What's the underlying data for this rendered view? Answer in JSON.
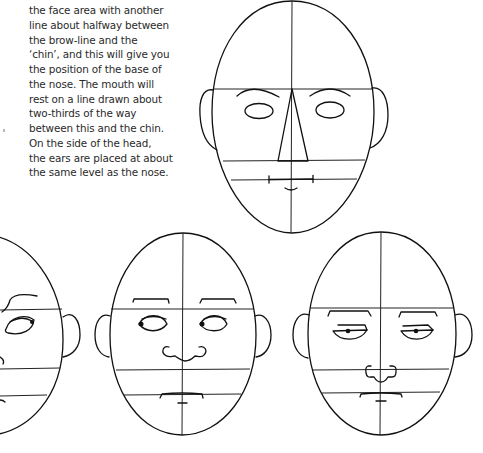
{
  "page": {
    "type": "book-page-excerpt",
    "background": "#ffffff",
    "ink_color": "#111111"
  },
  "text_block": {
    "lines": [
      "the face area with another",
      "line about halfway between",
      "the brow-line and the",
      "‘chin’, and this will give you",
      "the position of the base of",
      "the nose. The mouth will",
      "rest on a line drawn about",
      "two-thirds of the way",
      "between this and the chin.",
      "On the side of the head,",
      "the ears are placed at about",
      "the same level as the nose."
    ]
  },
  "illustrations": [
    {
      "id": "face-construction-guides",
      "description": "Egg-shaped head with center line, brow line, nose line and mouth line; triangular nose guide; oval eyes; ears aligned between brow and nose lines",
      "features": [
        "center-line",
        "brow-line",
        "nose-line",
        "mouth-line",
        "triangle-nose",
        "oval-eyes",
        "arched-brows",
        "ears"
      ]
    },
    {
      "id": "face-partial-left",
      "description": "Partially visible head cropped at left edge with raised brow and half-closed eye",
      "features": [
        "brow-line",
        "nose-line",
        "mouth-line",
        "raised-brow",
        "eye-with-pupil",
        "ear"
      ]
    },
    {
      "id": "face-looking-sideways",
      "description": "Egg-shaped head with eyes glancing left, rounded nose, flat mouth",
      "features": [
        "center-line",
        "brow-line",
        "nose-line",
        "mouth-line",
        "flat-brows",
        "sideways-eyes",
        "rounded-nose",
        "flat-mouth",
        "ears"
      ]
    },
    {
      "id": "face-heavy-lidded",
      "description": "Egg-shaped head with heavy-lidded eyes, squared nose and straight mouth",
      "features": [
        "center-line",
        "brow-line",
        "nose-line",
        "mouth-line",
        "flat-brows",
        "heavy-lidded-eyes",
        "squared-nose",
        "straight-mouth",
        "ears"
      ]
    }
  ]
}
